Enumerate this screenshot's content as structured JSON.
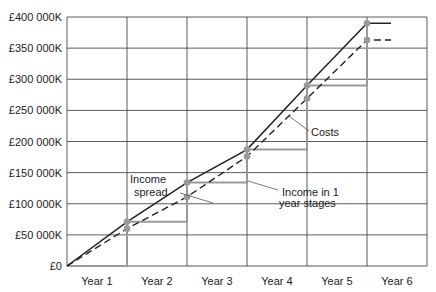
{
  "chart_data": {
    "type": "line",
    "title": "",
    "xlabel": "",
    "ylabel": "",
    "ylim": [
      0,
      400000
    ],
    "y_ticks": [
      0,
      50000,
      100000,
      150000,
      200000,
      250000,
      300000,
      350000,
      400000
    ],
    "y_tick_labels": [
      "£0",
      "£50 000K",
      "£100 000K",
      "£150 000K",
      "£200 000K",
      "£250 000K",
      "£300 000K",
      "£350 000K",
      "£400 000K"
    ],
    "x_categories": [
      "Year 1",
      "Year 2",
      "Year 3",
      "Year 4",
      "Year 5",
      "Year 6"
    ],
    "xlim": [
      0,
      6
    ],
    "grid": true,
    "series": [
      {
        "name": "Income spread",
        "style": "solid",
        "color": "#222222",
        "x": [
          0,
          1,
          2,
          3,
          4,
          5,
          5.4
        ],
        "y": [
          0,
          71000,
          134000,
          187000,
          290000,
          390000,
          390000
        ]
      },
      {
        "name": "Costs",
        "style": "dashed",
        "color": "#222222",
        "x": [
          0,
          1,
          2,
          3,
          4,
          5,
          5.4
        ],
        "y": [
          0,
          60000,
          111000,
          176000,
          269000,
          363000,
          363000
        ]
      },
      {
        "name": "Income in 1 year stages",
        "style": "step",
        "color": "#999999",
        "x": [
          0,
          1,
          1,
          2,
          2,
          3,
          3,
          4,
          4,
          5,
          5
        ],
        "y": [
          0,
          0,
          71000,
          71000,
          134000,
          134000,
          187000,
          187000,
          290000,
          290000,
          390000
        ]
      }
    ],
    "markers": {
      "color": "#999999",
      "points": [
        {
          "x": 1,
          "y": 71000
        },
        {
          "x": 1,
          "y": 60000
        },
        {
          "x": 2,
          "y": 134000
        },
        {
          "x": 2,
          "y": 111000
        },
        {
          "x": 3,
          "y": 187000
        },
        {
          "x": 3,
          "y": 176000
        },
        {
          "x": 4,
          "y": 290000
        },
        {
          "x": 4,
          "y": 269000
        },
        {
          "x": 5,
          "y": 390000
        },
        {
          "x": 5,
          "y": 363000
        }
      ]
    },
    "annotations": [
      {
        "text": [
          "Income",
          "spread"
        ],
        "target_series": "Income spread"
      },
      {
        "text": [
          "Income in 1",
          "year stages"
        ],
        "target_series": "Income in 1 year stages"
      },
      {
        "text": [
          "Costs"
        ],
        "target_series": "Costs"
      }
    ]
  }
}
